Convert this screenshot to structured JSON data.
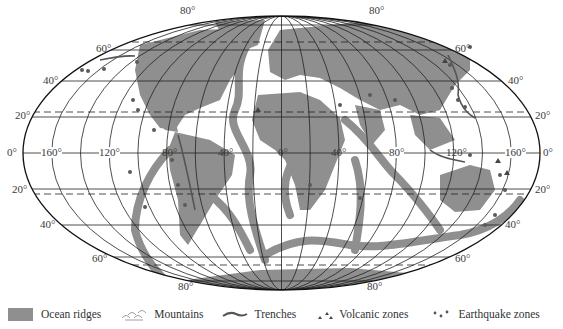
{
  "map": {
    "projection": "Mollweide (world)",
    "colors": {
      "land_and_ridges": "#8f8f8f",
      "ocean": "#ffffff",
      "grid": "#222222",
      "markers": "#5a5a5a"
    },
    "latitude_labels": {
      "n80_left": "80°",
      "n80_right": "80°",
      "n60_left": "60°",
      "n60_right": "60°",
      "n40_left": "40°",
      "n40_right": "40°",
      "n20_left": "20°",
      "n20_right": "20°",
      "eq_left": "0°",
      "eq_right": "0°",
      "s20_left": "20°",
      "s20_right": "20°",
      "s40_left": "40°",
      "s40_right": "40°",
      "s60_left": "60°",
      "s60_right": "60°",
      "s80_left": "80°",
      "s80_right": "80°"
    },
    "longitude_labels": {
      "w160": "160°",
      "w120": "120°",
      "w80": "80°",
      "w40": "40°",
      "zero": "0°",
      "e40": "40°",
      "e80": "80°",
      "e120": "120°",
      "e160": "160°"
    }
  },
  "legend": {
    "items": [
      {
        "label": "Ocean ridges",
        "icon": "gray-swatch"
      },
      {
        "label": "Mountains",
        "icon": "mountain-hatch"
      },
      {
        "label": "Trenches",
        "icon": "wavy-line"
      },
      {
        "label": "Volcanic zones",
        "icon": "triangles"
      },
      {
        "label": "Earthquake zones",
        "icon": "dots"
      }
    ]
  }
}
